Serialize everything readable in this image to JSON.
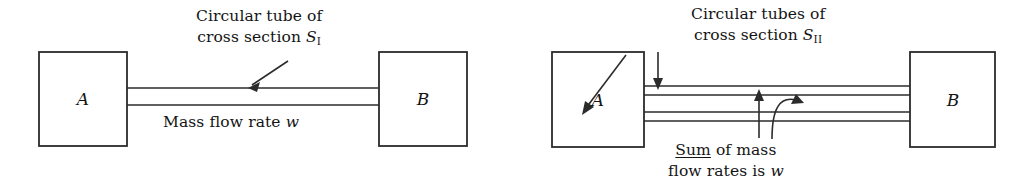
{
  "figure": {
    "background_color": "#ffffff",
    "line_color": "#2b2b2b",
    "text_color": "#141414"
  },
  "panels": [
    {
      "id": "case-1",
      "vessel_left_label": "A",
      "vessel_right_label": "B",
      "tube_count": 1,
      "caption_tube": {
        "line1": "Circular tube of",
        "line2_prefix": "cross section ",
        "line2_symbol": "S",
        "line2_subscript": "I"
      },
      "caption_flow": {
        "text_prefix": "Mass flow rate ",
        "symbol": "w"
      }
    },
    {
      "id": "case-2",
      "vessel_left_label": "A",
      "vessel_right_label": "B",
      "tube_count": 2,
      "caption_tube": {
        "line1": "Circular tubes of",
        "line2_prefix": "cross section ",
        "line2_symbol": "S",
        "line2_subscript": "II"
      },
      "caption_flow": {
        "emphasized_word": "Sum",
        "line1_rest": " of mass",
        "line2_prefix": "flow rates is ",
        "symbol": "w"
      }
    }
  ]
}
